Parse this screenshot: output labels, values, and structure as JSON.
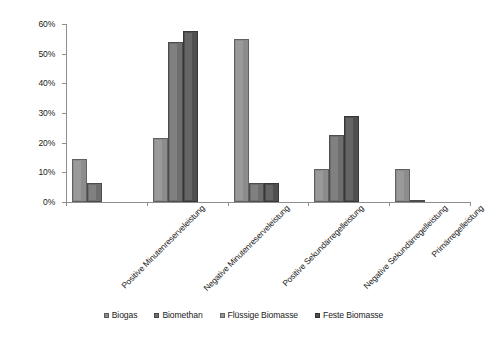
{
  "chart_data": {
    "type": "bar",
    "title": "",
    "xlabel": "",
    "ylabel": "Anteilige präqualifizierte Anlagenleistung",
    "ylim": [
      0,
      0.6
    ],
    "ytick_labels": [
      "0%",
      "10%",
      "20%",
      "30%",
      "40%",
      "50%",
      "60%"
    ],
    "ytick_values": [
      0,
      10,
      20,
      30,
      40,
      50,
      60
    ],
    "grid": false,
    "legend_position": "bottom",
    "categories": [
      "Positive Minutenreserveleistung",
      "Negative Minutenreserveleistung",
      "Positive Sekundärregelleistung",
      "Negative Sekundärregelleistung",
      "Primärregelleistung"
    ],
    "series": [
      {
        "name": "Biogas",
        "color": "#8c8c8c",
        "values": [
          14.5,
          21.5,
          55.0,
          11.0,
          11.0
        ]
      },
      {
        "name": "Biomethan",
        "color": "#6e6e6e",
        "values": [
          6.5,
          54.0,
          6.5,
          22.5,
          0.7
        ]
      },
      {
        "name": "Flüssige Biomasse",
        "color": "#9a9a9a",
        "values": [
          0,
          0,
          0,
          0,
          0
        ]
      },
      {
        "name": "Feste Biomasse",
        "color": "#4f4f4f",
        "values": [
          0,
          57.5,
          6.5,
          29.0,
          0
        ]
      }
    ]
  },
  "legend": {
    "items": [
      {
        "label": "Biogas",
        "color": "#8c8c8c"
      },
      {
        "label": "Biomethan",
        "color": "#6e6e6e"
      },
      {
        "label": "Flüssige Biomasse",
        "color": "#9a9a9a"
      },
      {
        "label": "Feste Biomasse",
        "color": "#4f4f4f"
      }
    ]
  }
}
